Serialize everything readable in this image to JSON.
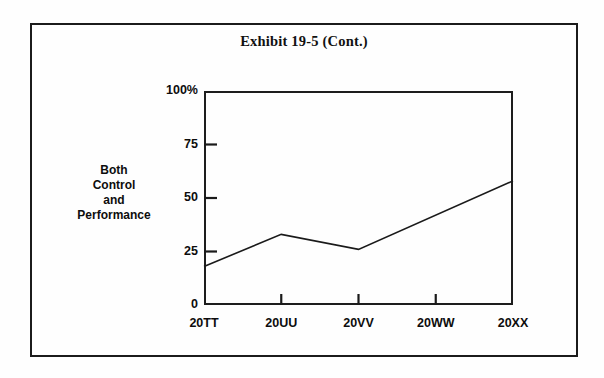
{
  "exhibit": {
    "title": "Exhibit 19-5 (Cont.)"
  },
  "axis_caption": {
    "line1": "Both",
    "line2": "Control",
    "line3": "and",
    "line4": "Performance"
  },
  "chart_data": {
    "type": "line",
    "title": "Exhibit 19-5 (Cont.)",
    "xlabel": "",
    "ylabel": "Both Control and Performance",
    "categories": [
      "20TT",
      "20UU",
      "20VV",
      "20WW",
      "20XX"
    ],
    "values": [
      18,
      33,
      26,
      42,
      58
    ],
    "vertices": [
      {
        "x": "20TT",
        "y": 18
      },
      {
        "x": "20UU",
        "y": 33
      },
      {
        "x": "20VV",
        "y": 26
      },
      {
        "x": "20XX",
        "y": 58
      }
    ],
    "ylim": [
      0,
      100
    ],
    "yticks": [
      0,
      25,
      50,
      75,
      100
    ],
    "ytick_labels": [
      "0",
      "25",
      "50",
      "75",
      "100%"
    ],
    "grid": false,
    "legend": null,
    "line_color": "#1a1a1a"
  },
  "colors": {
    "frame": "#1b1b1b",
    "axis": "#1d1d1d",
    "line": "#1a1a1a",
    "text": "#0d0d0d",
    "background": "#fefefe"
  }
}
